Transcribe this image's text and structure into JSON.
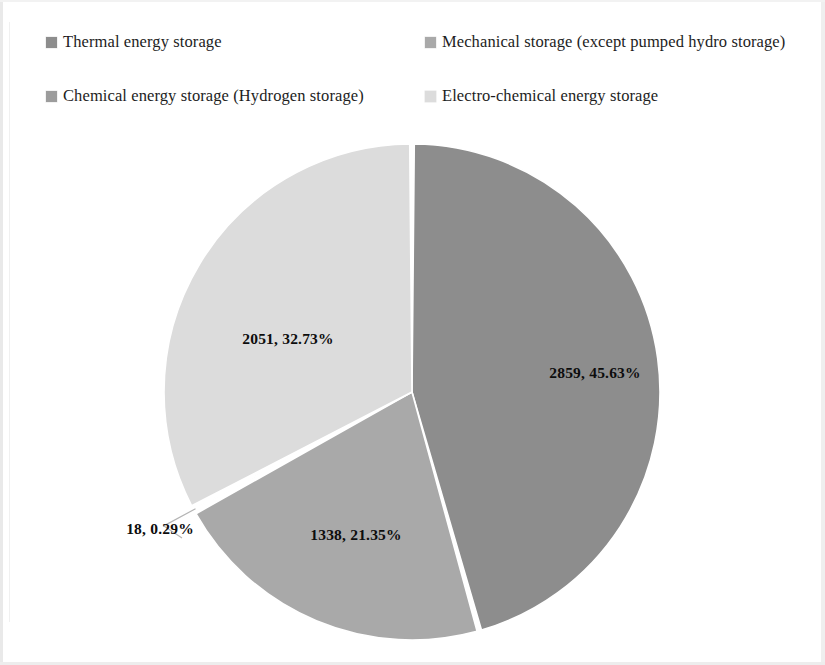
{
  "legend": {
    "items": [
      {
        "label": "Thermal energy storage",
        "color": "#8d8d8d",
        "marker": "square-marker"
      },
      {
        "label": "Mechanical storage (except pumped hydro storage)",
        "color": "#a9a9a9",
        "marker": "square-marker"
      },
      {
        "label": "Chemical energy storage (Hydrogen storage)",
        "color": "#9c9c9c",
        "marker": "square-marker"
      },
      {
        "label": "Electro-chemical energy storage",
        "color": "#dcdcdc",
        "marker": "square-marker"
      }
    ]
  },
  "labels": {
    "thermal": "2859, 45.63%",
    "mechanical": "1338, 21.35%",
    "chemical": "18, 0.29%",
    "electrochemical": "2051, 32.73%"
  },
  "chart_data": {
    "type": "pie",
    "title": "",
    "categories": [
      "Thermal energy storage",
      "Mechanical storage (except pumped hydro storage)",
      "Chemical energy storage (Hydrogen storage)",
      "Electro-chemical energy storage"
    ],
    "values": [
      2859,
      1338,
      18,
      2051
    ],
    "percentages": [
      45.63,
      21.35,
      0.29,
      32.73
    ],
    "data_labels": [
      "2859, 45.63%",
      "1338, 21.35%",
      "18, 0.29%",
      "2051, 32.73%"
    ],
    "colors": [
      "#8d8d8d",
      "#a9a9a9",
      "#9c9c9c",
      "#dcdcdc"
    ],
    "total": 6266,
    "start_angle_deg": 0,
    "direction": "clockwise",
    "legend_position": "top",
    "grid": false,
    "xlabel": "",
    "ylabel": ""
  }
}
